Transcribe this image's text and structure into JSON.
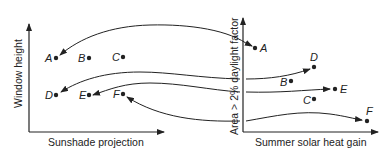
{
  "diagram": {
    "left_panel": {
      "x_axis_label": "Sunshade projection",
      "y_axis_label": "Window height",
      "points": [
        {
          "id": "A",
          "x": 56,
          "y": 58
        },
        {
          "id": "B",
          "x": 89,
          "y": 58
        },
        {
          "id": "C",
          "x": 123,
          "y": 57
        },
        {
          "id": "D",
          "x": 56,
          "y": 95
        },
        {
          "id": "E",
          "x": 89,
          "y": 95
        },
        {
          "id": "F",
          "x": 123,
          "y": 94
        }
      ]
    },
    "right_panel": {
      "x_axis_label": "Summer solar heat gain",
      "y_axis_label": "Area > 2% daylight factor",
      "points": [
        {
          "id": "A",
          "x": 255,
          "y": 48
        },
        {
          "id": "D",
          "x": 314,
          "y": 67
        },
        {
          "id": "B",
          "x": 291,
          "y": 81
        },
        {
          "id": "E",
          "x": 335,
          "y": 89
        },
        {
          "id": "C",
          "x": 314,
          "y": 99
        },
        {
          "id": "F",
          "x": 367,
          "y": 121
        }
      ]
    },
    "mappings": [
      {
        "from": "A (right)",
        "to": "A (left)"
      },
      {
        "from": "D (right)",
        "to": "D (left)"
      },
      {
        "from": "E (right)",
        "to": "E (left)"
      },
      {
        "from": "F (right)",
        "to": "F (left)"
      }
    ],
    "colors": {
      "ink": "#222222",
      "background": "#ffffff"
    }
  }
}
